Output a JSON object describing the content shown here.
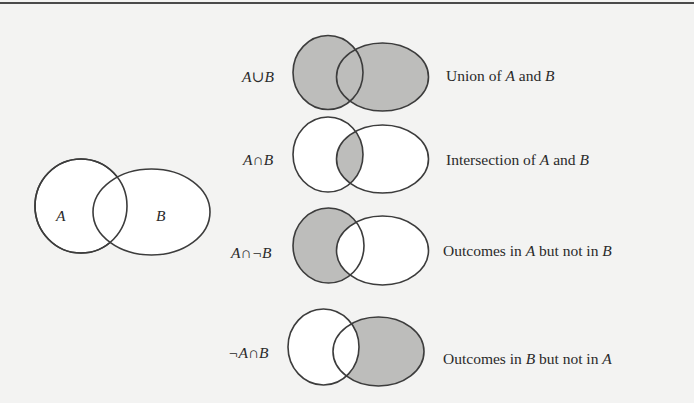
{
  "colors": {
    "background": "#f3f3f2",
    "shade": "#bdbdbb",
    "stroke": "#3c3c3c",
    "unshaded": "#ffffff",
    "rule": "#4a4a4a"
  },
  "base_diagram": {
    "label_a": "A",
    "label_b": "B"
  },
  "operations": [
    {
      "expression": "A∪B",
      "description": {
        "pre": "Union of ",
        "a": "A",
        "mid": " and ",
        "b": "B",
        "post": ""
      },
      "shaded_region": "A or B"
    },
    {
      "expression": "A∩B",
      "description": {
        "pre": "Intersection of ",
        "a": "A",
        "mid": " and ",
        "b": "B",
        "post": ""
      },
      "shaded_region": "A and B"
    },
    {
      "expression": "A∩¬B",
      "description": {
        "pre": "Outcomes in ",
        "a": "A",
        "mid": " but not in ",
        "b": "B",
        "post": ""
      },
      "shaded_region": "A only"
    },
    {
      "expression": "¬A∩B",
      "description": {
        "pre": "Outcomes in ",
        "a": "B",
        "mid": " but not in ",
        "b": "A",
        "post": ""
      },
      "shaded_region": "B only"
    }
  ]
}
